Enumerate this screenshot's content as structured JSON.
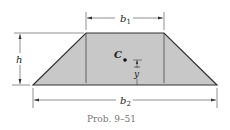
{
  "figure": {
    "caption": "Prob. 9–51",
    "labels": {
      "top_width": "b",
      "top_width_sub": "1",
      "bottom_width": "b",
      "bottom_width_sub": "2",
      "height": "h",
      "centroid": "C",
      "centroid_offset": "y"
    },
    "colors": {
      "fill": "#c8c8c8",
      "stroke": "#333333",
      "caption": "#777777"
    }
  }
}
